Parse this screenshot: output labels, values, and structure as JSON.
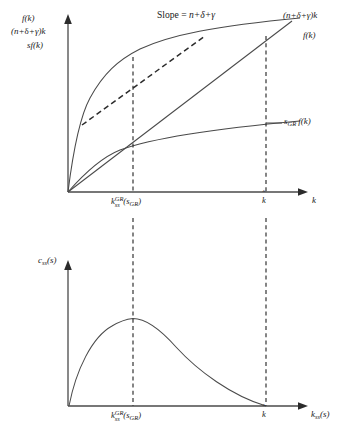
{
  "figure": {
    "type": "diagram"
  },
  "top_panel": {
    "y_axis_labels": [
      "f(k)",
      "(n+δ+γ)k",
      "sf(k)"
    ],
    "y_axis_label_1": "f(k)",
    "y_axis_label_2_pre": "(n+",
    "y_axis_label_2_mid": "δ",
    "y_axis_label_2_post": "+γ)k",
    "y_axis_label_3_s": "s",
    "y_axis_label_3_f": "f(k)",
    "x_axis_label": "k",
    "slope_annotation_text": "Slope = ",
    "slope_annotation_value": "n+δ+γ",
    "curve_label_line": "(n+δ+γ)k",
    "curve_label_production": "f(k)",
    "curve_label_saving_s": "s",
    "curve_label_saving_sub": "GR",
    "curve_label_saving_f": " f(k)",
    "tick_golden_k": "k",
    "tick_golden_sup": "GR",
    "tick_golden_sub": "ss",
    "tick_golden_arg_open": "(",
    "tick_golden_arg_s": "s",
    "tick_golden_arg_sub": "GR",
    "tick_golden_arg_close": ")",
    "tick_khat": "k",
    "tick_khat_accent": "ˆ"
  },
  "bottom_panel": {
    "y_axis_label_c": "c",
    "y_axis_label_sub": "ss",
    "y_axis_label_arg": "(s)",
    "x_axis_label_k": "k",
    "x_axis_label_sub": "ss",
    "x_axis_label_arg": "(s)",
    "tick_golden_k": "k",
    "tick_golden_sup": "GR",
    "tick_golden_sub": "ss",
    "tick_golden_arg_open": "(",
    "tick_golden_arg_s": "s",
    "tick_golden_arg_sub": "GR",
    "tick_golden_arg_close": ")",
    "tick_khat": "k",
    "tick_khat_accent": "ˆ"
  },
  "style": {
    "line_color": "#3a3a3a",
    "curve_color": "#4a4a4a",
    "dash_color": "#2b2b2b",
    "axis_color": "#4a4a4a",
    "text_color": "#1a1a1a",
    "background": "#ffffff"
  },
  "geometry": {
    "top_origin_x": 68,
    "top_origin_y": 192,
    "top_k_golden_x": 133,
    "top_k_hat_x": 266,
    "bottom_origin_x": 68,
    "bottom_origin_y": 406,
    "bottom_k_golden_x": 133,
    "bottom_k_hat_x": 266
  }
}
